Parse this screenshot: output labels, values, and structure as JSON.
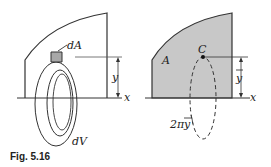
{
  "figure": {
    "caption": "Fig. 5.16",
    "colors": {
      "line": "#333333",
      "region_fill": "#c8c8c8",
      "element_fill": "#a8a8a8",
      "background": "#ffffff"
    }
  },
  "left_panel": {
    "element_area_label": "dA",
    "element_volume_label": "dV",
    "height_label": "y",
    "axis_label": "x"
  },
  "right_panel": {
    "area_label": "A",
    "centroid_label": "C",
    "centroid_height_label": "y",
    "path_label_prefix": "2π",
    "path_label_var": "y",
    "axis_label": "x"
  }
}
